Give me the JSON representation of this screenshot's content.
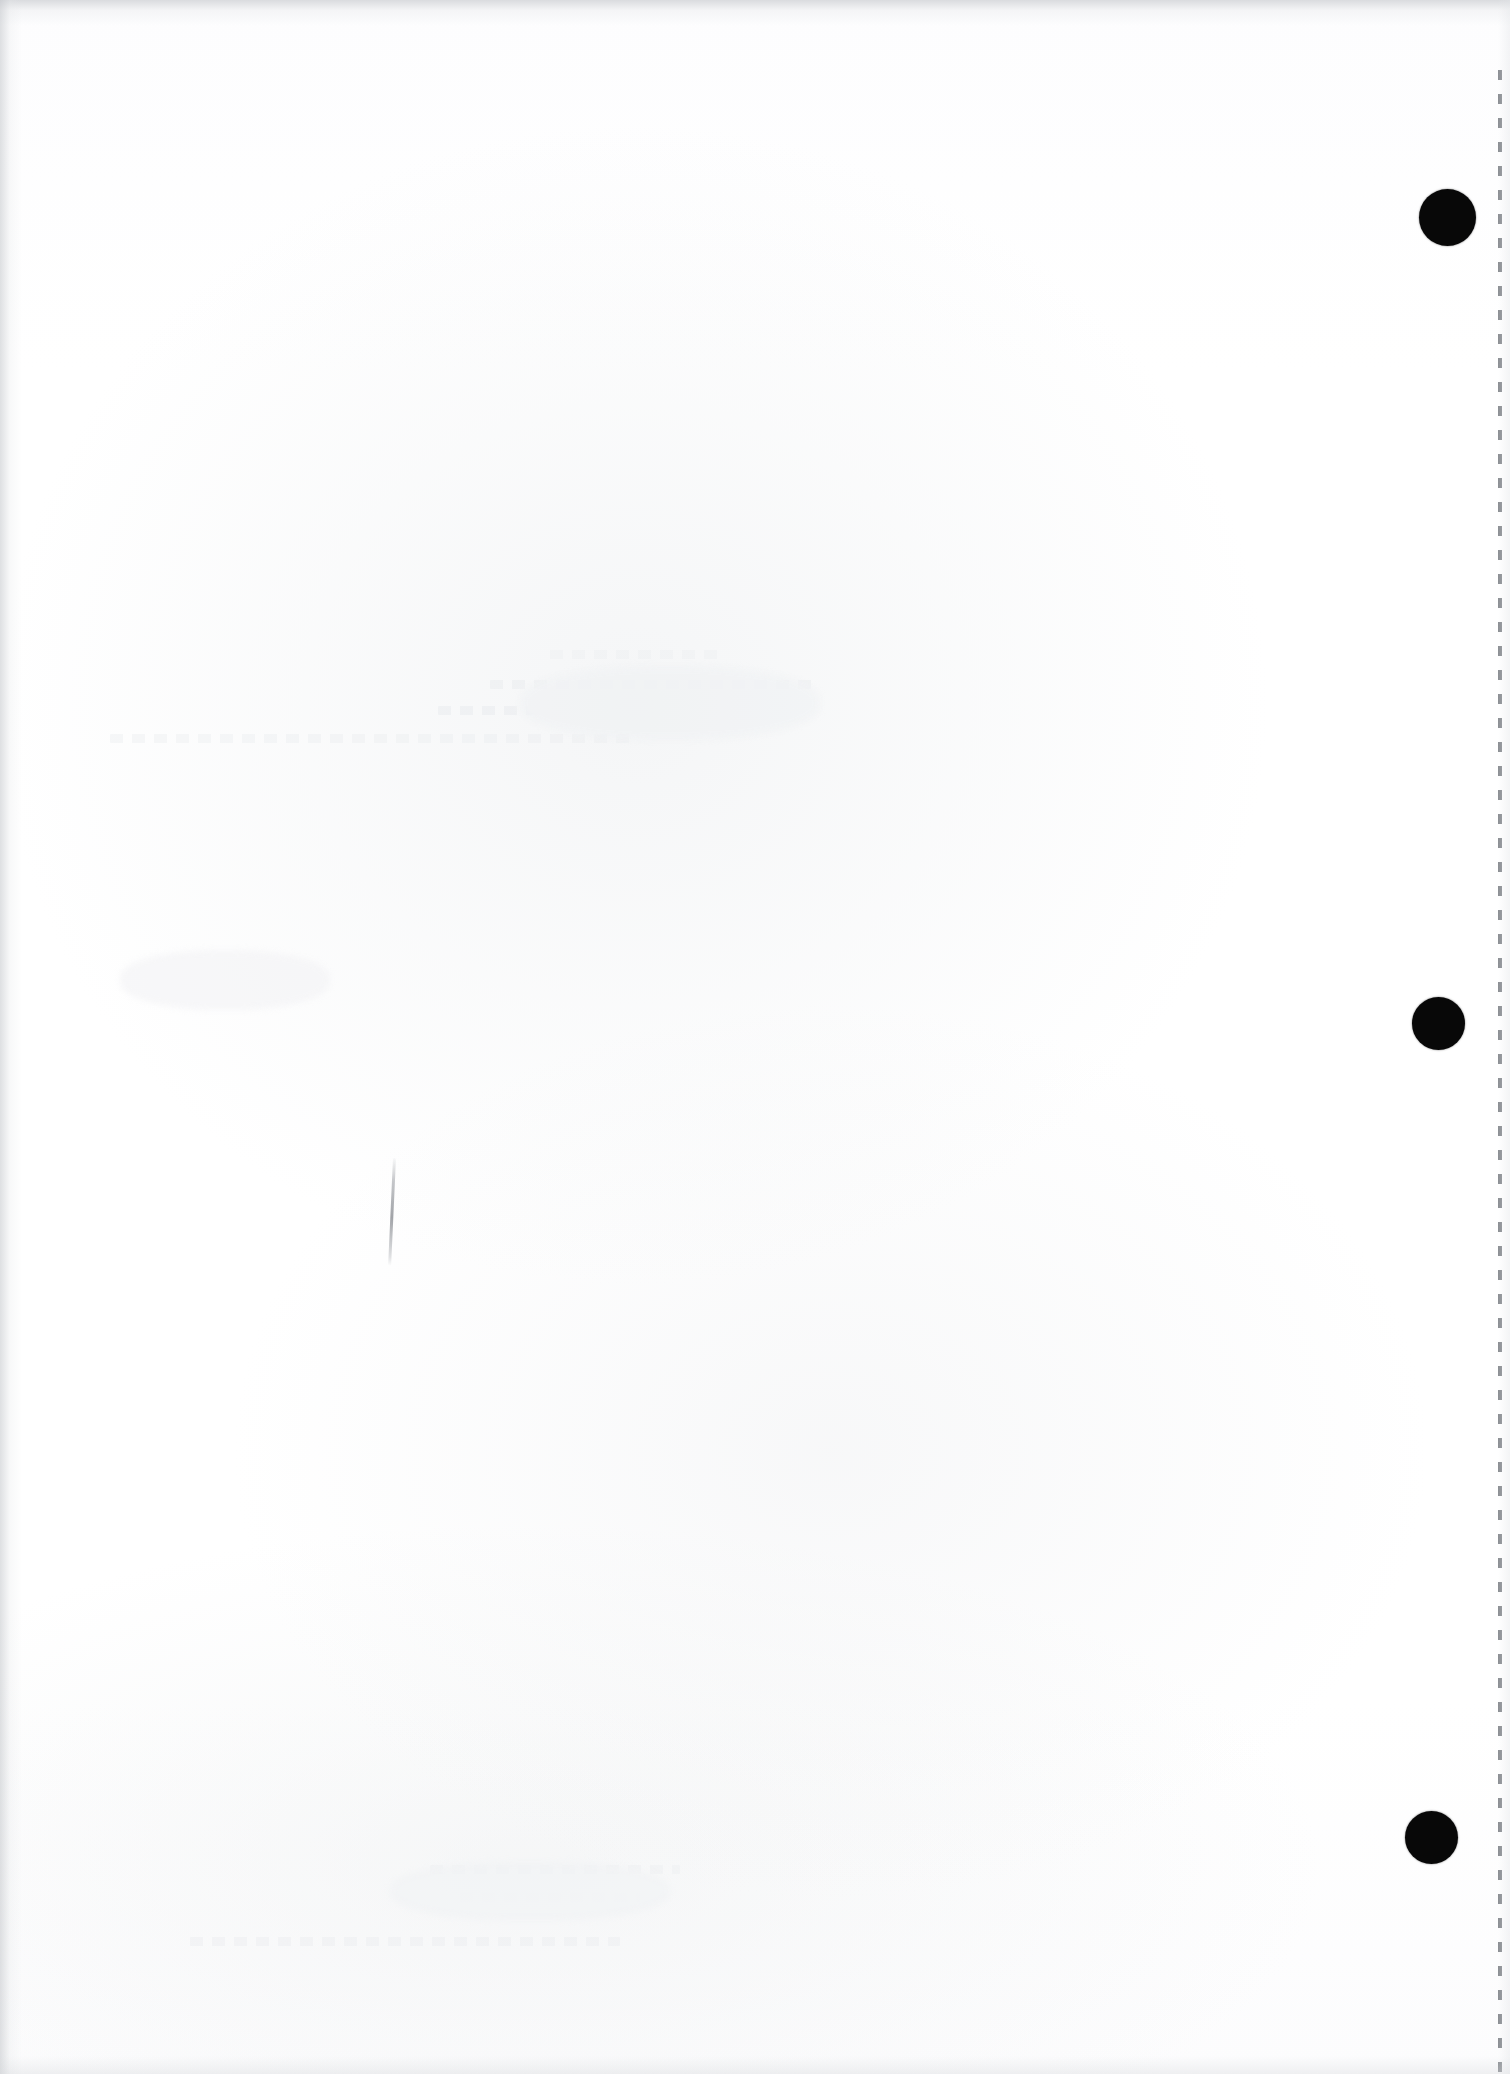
{
  "document": {
    "type": "scanned-page",
    "title": "Scanned blank document page",
    "page_state": "blank",
    "visible_text": "",
    "background_color": "#ffffff",
    "paper_tone": "#fdfdfe",
    "scan_edge_color": "#c4c7cb",
    "orientation": "portrait",
    "width_px": 1510,
    "height_px": 2074
  },
  "marks": {
    "punch_holes": {
      "label": "hole-punch marks",
      "color": "#080808",
      "count": 3,
      "items": [
        {
          "name": "punch-hole-top",
          "cx": 1447,
          "cy": 217,
          "diameter": 57
        },
        {
          "name": "punch-hole-middle",
          "cx": 1438,
          "cy": 1023,
          "diameter": 53
        },
        {
          "name": "punch-hole-bottom",
          "cx": 1431,
          "cy": 1837,
          "diameter": 53
        }
      ]
    },
    "perforation": {
      "label": "perforated right margin",
      "color": "#6c7076",
      "x": 1498,
      "y_start": 70,
      "y_end": 2074,
      "dash_width": 4,
      "dash_length": 10,
      "dash_gap": 14
    },
    "pen_stroke": {
      "label": "faint vertical pen stroke",
      "color": "#686c73",
      "x": 393,
      "y": 1158,
      "length": 108,
      "thickness": 3
    },
    "ghosting": {
      "label": "bleed-through ghost text from reverse side",
      "color": "#e7e9ec",
      "bands": [
        {
          "name": "ghost-band-upper",
          "x": 430,
          "y": 655,
          "width": 600,
          "lines": 4
        },
        {
          "name": "ghost-band-lower",
          "x": 130,
          "y": 1880,
          "width": 560,
          "lines": 3
        }
      ]
    }
  }
}
